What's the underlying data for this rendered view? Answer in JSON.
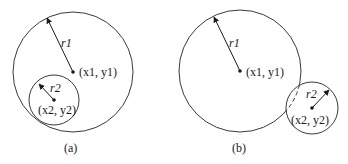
{
  "colors": {
    "stroke": "#3a3a3a",
    "text": "#1a1a1a",
    "background": "#ffffff"
  },
  "panels": [
    {
      "id": "a",
      "caption": "(a)",
      "big_circle": {
        "cx": 73,
        "cy": 72,
        "r": 60,
        "radius_label": "r1",
        "center_label": "(x1, y1)"
      },
      "small_circle": {
        "cx": 54,
        "cy": 100,
        "r": 25,
        "radius_label": "r2",
        "center_label": "(x2, y2)"
      },
      "relation": "small circle inside big circle"
    },
    {
      "id": "b",
      "caption": "(b)",
      "big_circle": {
        "cx": 240,
        "cy": 71,
        "r": 61,
        "radius_label": "r1",
        "center_label": "(x1, y1)"
      },
      "small_circle": {
        "cx": 312,
        "cy": 108,
        "r": 26,
        "radius_label": "r2",
        "center_label": "(x2, y2)"
      },
      "relation": "circles overlap; hidden arc dashed"
    }
  ],
  "labels": {
    "a_r1": "r1",
    "a_c1": "(x1, y1)",
    "a_r2": "r2",
    "a_c2": "(x2, y2)",
    "a_caption": "(a)",
    "b_r1": "r1",
    "b_c1": "(x1, y1)",
    "b_r2": "r2",
    "b_c2": "(x2, y2)",
    "b_caption": "(b)"
  }
}
